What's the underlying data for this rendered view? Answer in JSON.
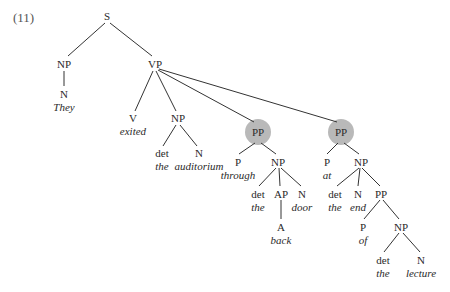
{
  "example_number": "(11)",
  "highlight_color": "#b9b9b9",
  "tree": {
    "root": "S",
    "nodes": {
      "S": "S",
      "np_subj": "NP",
      "vp": "VP",
      "n_subj": "N",
      "w_they": "They",
      "v": "V",
      "w_exited": "exited",
      "np_obj": "NP",
      "det1": "det",
      "w_the1": "the",
      "n_obj": "N",
      "w_auditorium": "auditorium",
      "pp1": "PP",
      "p1": "P",
      "w_through": "through",
      "np_pp1": "NP",
      "det2": "det",
      "w_the2": "the",
      "ap": "AP",
      "a": "A",
      "w_back": "back",
      "n_door": "N",
      "w_door": "door",
      "pp2": "PP",
      "p2": "P",
      "w_at": "at",
      "np_pp2": "NP",
      "det3": "det",
      "w_the3": "the",
      "n_end": "N",
      "w_end": "end",
      "pp3": "PP",
      "p3": "P",
      "w_of": "of",
      "np_pp3": "NP",
      "det4": "det",
      "w_the4": "the",
      "n_lecture": "N",
      "w_lecture": "lecture"
    },
    "highlighted_nodes": [
      "pp1",
      "pp2"
    ],
    "sentence": "They exited the auditorium through the back door at the end of the lecture"
  }
}
